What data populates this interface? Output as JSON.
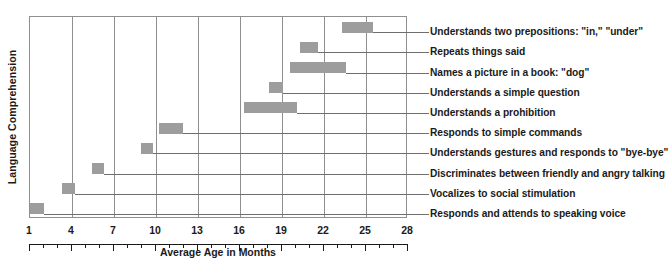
{
  "chart_data": {
    "type": "bar",
    "orientation": "horizontal",
    "title": "",
    "xlabel": "Average Age in Months",
    "ylabel": "Language Comprehension",
    "xlim": [
      1,
      28
    ],
    "xticks": [
      1,
      4,
      7,
      10,
      13,
      16,
      19,
      22,
      25,
      28
    ],
    "xtick_labels": [
      "1",
      "4",
      "7",
      "10",
      "13",
      "16",
      "19",
      "22",
      "25",
      "28"
    ],
    "minor_tick_interval": 1,
    "grid": "vertical-major",
    "legend": "none",
    "bar_color": "#9d9d9d",
    "axis_color": "#8f8f8f",
    "text_color": "#1a1a1a",
    "categories": [
      "Understands two prepositions: \"in,\" \"under\"",
      "Repeats things said",
      "Names a picture in a book: \"dog\"",
      "Understands a simple question",
      "Understands a prohibition",
      "Responds to simple commands",
      "Understands gestures and responds to \"bye-bye\"",
      "Discriminates between friendly and angry talking",
      "Vocalizes to social stimulation",
      "Responds and attends to speaking voice"
    ],
    "ranges": [
      {
        "label": "Understands two prepositions: \"in,\" \"under\"",
        "start": 23.3,
        "end": 25.5
      },
      {
        "label": "Repeats things said",
        "start": 20.3,
        "end": 21.6
      },
      {
        "label": "Names a picture in a book: \"dog\"",
        "start": 19.6,
        "end": 23.6
      },
      {
        "label": "Understands a simple question",
        "start": 18.1,
        "end": 19.1
      },
      {
        "label": "Understands a prohibition",
        "start": 16.3,
        "end": 20.1
      },
      {
        "label": "Responds to simple commands",
        "start": 10.2,
        "end": 11.9
      },
      {
        "label": "Understands gestures and responds to \"bye-bye\"",
        "start": 8.9,
        "end": 9.8
      },
      {
        "label": "Discriminates between friendly and angry talking",
        "start": 5.4,
        "end": 6.3
      },
      {
        "label": "Vocalizes to social stimulation",
        "start": 3.3,
        "end": 4.2
      },
      {
        "label": "Responds and attends to speaking voice",
        "start": 1.0,
        "end": 2.0
      }
    ]
  }
}
